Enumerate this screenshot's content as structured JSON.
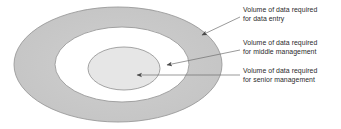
{
  "figure": {
    "type": "concentric-ellipse-diagram",
    "background_color": "#ffffff",
    "text_color": "#2b2b2b",
    "line_color": "#6e6e6e"
  },
  "ellipses": [
    {
      "name": "outer-ring",
      "meaning": "Volume of data required for data entry",
      "fill": "#c9c9c9",
      "stroke": "#9a9a9a",
      "cx": 118,
      "cy": 64.5,
      "rx": 104,
      "ry": 57.5
    },
    {
      "name": "middle-ring",
      "meaning": "Volume of data required for middle management",
      "fill": "#ffffff",
      "stroke": "#9a9a9a",
      "cx": 122,
      "cy": 64.5,
      "rx": 67,
      "ry": 37.5
    },
    {
      "name": "inner-ellipse",
      "meaning": "Volume of data required for senior management",
      "fill": "#e6e6e6",
      "stroke": "#9a9a9a",
      "cx": 124,
      "cy": 68.5,
      "rx": 36,
      "ry": 21.5
    }
  ],
  "callouts": [
    {
      "id": "data-entry",
      "line1": "Volume of data required",
      "line2": "for data entry",
      "leader": {
        "x1": 240,
        "y1": 17,
        "x2": 202,
        "y2": 35
      }
    },
    {
      "id": "middle-management",
      "line1": "Volume of data required",
      "line2": "for middle management",
      "leader": {
        "x1": 240,
        "y1": 50,
        "x2": 167,
        "y2": 65
      }
    },
    {
      "id": "senior-management",
      "line1": "Volume of data required",
      "line2": "for senior management",
      "leader": {
        "x1": 240,
        "y1": 75,
        "x2": 137,
        "y2": 75
      }
    }
  ]
}
